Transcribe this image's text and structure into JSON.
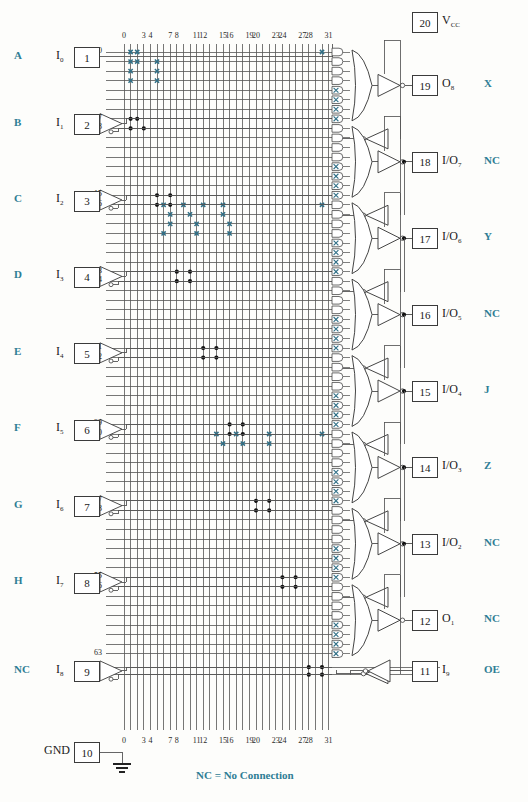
{
  "diagram": {
    "legend_text": "NC = No Connection",
    "colors": {
      "blue": "#2f7d95",
      "wire": "#555555",
      "fuse_x": "#2f6f86",
      "dot": "#111111",
      "box_border": "#3b3b3b"
    }
  },
  "column_labels": [
    "0",
    "3",
    "4",
    "7",
    "8",
    "11",
    "12",
    "15",
    "16",
    "19",
    "20",
    "23",
    "24",
    "27",
    "28",
    "31"
  ],
  "column_label_indices": [
    0,
    3,
    4,
    7,
    8,
    11,
    12,
    15,
    16,
    19,
    20,
    23,
    24,
    27,
    28,
    31
  ],
  "row_labels": [
    "0",
    "7",
    "8",
    "15",
    "16",
    "23",
    "24",
    "31",
    "32",
    "39",
    "40",
    "47",
    "48",
    "55",
    "56",
    "63"
  ],
  "row_label_indices": [
    0,
    7,
    8,
    15,
    16,
    23,
    24,
    31,
    32,
    39,
    40,
    47,
    48,
    55,
    56,
    63
  ],
  "left_pins": [
    {
      "tag": "A",
      "signal": "I",
      "sub": "0",
      "pin": "1",
      "buffer": false
    },
    {
      "tag": "B",
      "signal": "I",
      "sub": "1",
      "pin": "2",
      "buffer": true
    },
    {
      "tag": "C",
      "signal": "I",
      "sub": "2",
      "pin": "3",
      "buffer": true
    },
    {
      "tag": "D",
      "signal": "I",
      "sub": "3",
      "pin": "4",
      "buffer": true
    },
    {
      "tag": "E",
      "signal": "I",
      "sub": "4",
      "pin": "5",
      "buffer": true
    },
    {
      "tag": "F",
      "signal": "I",
      "sub": "5",
      "pin": "6",
      "buffer": true
    },
    {
      "tag": "G",
      "signal": "I",
      "sub": "6",
      "pin": "7",
      "buffer": true
    },
    {
      "tag": "H",
      "signal": "I",
      "sub": "7",
      "pin": "8",
      "buffer": true
    },
    {
      "tag": "NC",
      "signal": "I",
      "sub": "8",
      "pin": "9",
      "buffer": true
    }
  ],
  "gnd_pin": {
    "label": "GND",
    "pin": "10"
  },
  "vcc_pin": {
    "pin": "20",
    "label": "V",
    "sub": "CC"
  },
  "right_pins": [
    {
      "pin": "19",
      "signal": "O",
      "sub": "8",
      "tag": "X"
    },
    {
      "pin": "18",
      "signal": "I/O",
      "sub": "7",
      "tag": "NC"
    },
    {
      "pin": "17",
      "signal": "I/O",
      "sub": "6",
      "tag": "Y"
    },
    {
      "pin": "16",
      "signal": "I/O",
      "sub": "5",
      "tag": "NC"
    },
    {
      "pin": "15",
      "signal": "I/O",
      "sub": "4",
      "tag": "J"
    },
    {
      "pin": "14",
      "signal": "I/O",
      "sub": "3",
      "tag": "Z"
    },
    {
      "pin": "13",
      "signal": "I/O",
      "sub": "2",
      "tag": "NC"
    },
    {
      "pin": "12",
      "signal": "O",
      "sub": "1",
      "tag": "NC"
    },
    {
      "pin": "11",
      "signal": "I",
      "sub": "9",
      "tag": "OE"
    }
  ],
  "array": {
    "columns": 32,
    "rows": 64,
    "product_terms_per_output": 8,
    "outputs": 8
  },
  "fuse_x_marks": [
    {
      "col": 1,
      "row": 0
    },
    {
      "col": 2,
      "row": 0
    },
    {
      "col": 1,
      "row": 1
    },
    {
      "col": 2,
      "row": 1
    },
    {
      "col": 1,
      "row": 2
    },
    {
      "col": 1,
      "row": 3
    },
    {
      "col": 5,
      "row": 1
    },
    {
      "col": 5,
      "row": 2
    },
    {
      "col": 5,
      "row": 3
    },
    {
      "col": 30,
      "row": 0
    },
    {
      "col": 6,
      "row": 16
    },
    {
      "col": 9,
      "row": 16
    },
    {
      "col": 12,
      "row": 16
    },
    {
      "col": 15,
      "row": 16
    },
    {
      "col": 7,
      "row": 17
    },
    {
      "col": 10,
      "row": 17
    },
    {
      "col": 15,
      "row": 17
    },
    {
      "col": 7,
      "row": 18
    },
    {
      "col": 11,
      "row": 18
    },
    {
      "col": 16,
      "row": 18
    },
    {
      "col": 6,
      "row": 19
    },
    {
      "col": 11,
      "row": 19
    },
    {
      "col": 16,
      "row": 19
    },
    {
      "col": 30,
      "row": 16
    },
    {
      "col": 14,
      "row": 40
    },
    {
      "col": 17,
      "row": 40
    },
    {
      "col": 22,
      "row": 40
    },
    {
      "col": 15,
      "row": 41
    },
    {
      "col": 18,
      "row": 41
    },
    {
      "col": 22,
      "row": 41
    },
    {
      "col": 30,
      "row": 40
    }
  ],
  "connection_dots": [
    {
      "col": 1,
      "row": 7
    },
    {
      "col": 2,
      "row": 7
    },
    {
      "col": 1,
      "row": 8
    },
    {
      "col": 3,
      "row": 8
    },
    {
      "col": 5,
      "row": 15
    },
    {
      "col": 7,
      "row": 15
    },
    {
      "col": 5,
      "row": 16
    },
    {
      "col": 7,
      "row": 16
    },
    {
      "col": 8,
      "row": 23
    },
    {
      "col": 10,
      "row": 23
    },
    {
      "col": 8,
      "row": 24
    },
    {
      "col": 10,
      "row": 24
    },
    {
      "col": 12,
      "row": 31
    },
    {
      "col": 14,
      "row": 31
    },
    {
      "col": 12,
      "row": 32
    },
    {
      "col": 14,
      "row": 32
    },
    {
      "col": 16,
      "row": 39
    },
    {
      "col": 18,
      "row": 39
    },
    {
      "col": 16,
      "row": 40
    },
    {
      "col": 18,
      "row": 40
    },
    {
      "col": 20,
      "row": 47
    },
    {
      "col": 22,
      "row": 47
    },
    {
      "col": 20,
      "row": 48
    },
    {
      "col": 22,
      "row": 48
    },
    {
      "col": 24,
      "row": 55
    },
    {
      "col": 26,
      "row": 55
    },
    {
      "col": 24,
      "row": 56
    },
    {
      "col": 26,
      "row": 56
    },
    {
      "col": 28,
      "row": 63
    },
    {
      "col": 30,
      "row": 63
    },
    {
      "col": 28,
      "row": 64
    },
    {
      "col": 30,
      "row": 64
    }
  ]
}
